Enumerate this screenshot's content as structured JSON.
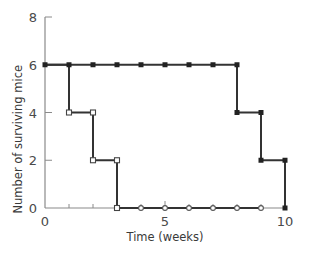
{
  "chart_data": {
    "type": "line",
    "subtype": "step",
    "title": "",
    "xlabel": "Time (weeks)",
    "ylabel": "Number of surviving mice",
    "xlim": [
      0,
      10
    ],
    "ylim": [
      0,
      8
    ],
    "x_ticks": [
      0,
      5,
      10
    ],
    "y_ticks": [
      0,
      2,
      4,
      6,
      8
    ],
    "grid": false,
    "legend": null,
    "series": [
      {
        "name": "filled markers",
        "marker": "filled-square",
        "color": "#333333",
        "x": [
          0,
          1,
          2,
          3,
          4,
          5,
          6,
          7,
          8,
          8,
          9,
          9,
          10,
          10
        ],
        "y": [
          6,
          6,
          6,
          6,
          6,
          6,
          6,
          6,
          6,
          4,
          4,
          2,
          2,
          0
        ],
        "steps": [
          {
            "week": 8,
            "from": 6,
            "to": 4
          },
          {
            "week": 9,
            "from": 4,
            "to": 2
          },
          {
            "week": 10,
            "from": 2,
            "to": 0
          }
        ]
      },
      {
        "name": "open markers",
        "marker": "open-square/open-circle",
        "color": "#333333",
        "x": [
          0,
          1,
          1,
          2,
          2,
          3,
          3,
          4,
          5,
          6,
          7,
          8,
          9
        ],
        "y": [
          6,
          6,
          4,
          4,
          2,
          2,
          0,
          0,
          0,
          0,
          0,
          0,
          0
        ],
        "steps": [
          {
            "week": 1,
            "from": 6,
            "to": 4
          },
          {
            "week": 2,
            "from": 4,
            "to": 2
          },
          {
            "week": 3,
            "from": 2,
            "to": 0
          }
        ]
      }
    ]
  },
  "labels": {
    "xlabel": "Time (weeks)",
    "ylabel": "Number of surviving mice",
    "x_tick_labels": [
      "0",
      "5",
      "10"
    ],
    "y_tick_labels": [
      "0",
      "2",
      "4",
      "6",
      "8"
    ]
  }
}
